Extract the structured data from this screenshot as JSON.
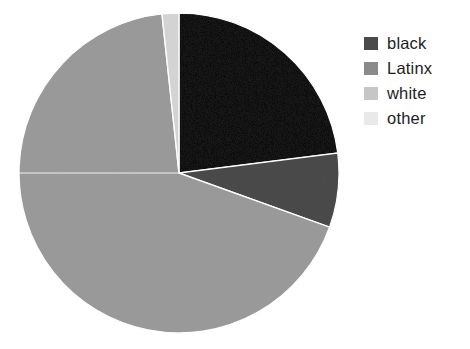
{
  "chart_data": {
    "type": "pie",
    "title": "",
    "categories": [
      "black",
      "Latinx",
      "white",
      "other"
    ],
    "values": [
      23.0,
      7.5,
      67.8,
      1.7
    ],
    "units": "percent",
    "start_angle_deg": 0,
    "direction": "clockwise",
    "slice_colors": [
      "#4a4a4a",
      "#8a8a8a",
      "#c6c6c6",
      "#e9e9e9"
    ],
    "edge_color": "#ffffff",
    "legend_position": "right",
    "legend_entries": [
      {
        "label": "black",
        "color": "#4a4a4a",
        "value": 23.0
      },
      {
        "label": "Latinx",
        "color": "#8a8a8a",
        "value": 7.5
      },
      {
        "label": "white",
        "color": "#c6c6c6",
        "value": 67.8
      },
      {
        "label": "other",
        "color": "#e9e9e9",
        "value": 1.7
      }
    ],
    "xlabel": "",
    "ylabel": "",
    "grid": false,
    "annotations": []
  },
  "figure": {
    "background": "#ffffff",
    "pie": {
      "center_x": 179,
      "center_y": 173,
      "radius": 160
    }
  },
  "legend": {
    "items": [
      {
        "label": "black"
      },
      {
        "label": "Latinx"
      },
      {
        "label": "white"
      },
      {
        "label": "other"
      }
    ]
  }
}
